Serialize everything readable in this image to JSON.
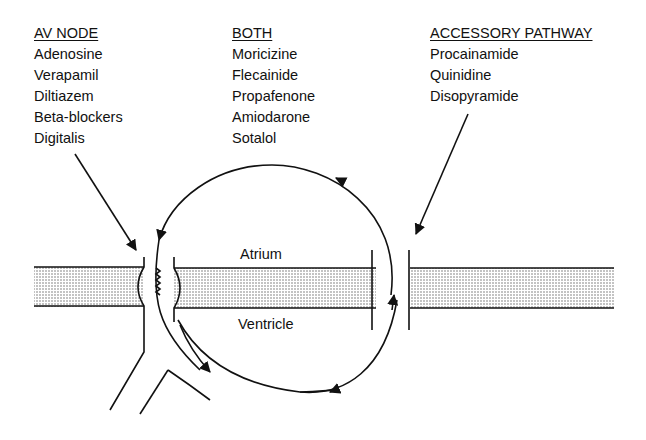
{
  "columns": [
    {
      "header": "AV NODE",
      "items": [
        "Adenosine",
        "Verapamil",
        "Diltiazem",
        "Beta-blockers",
        "Digitalis"
      ]
    },
    {
      "header": "BOTH",
      "items": [
        "Moricizine",
        "Flecainide",
        "Propafenone",
        "Amiodarone",
        "Sotalol"
      ]
    },
    {
      "header": "ACCESSORY PATHWAY",
      "items": [
        "Procainamide",
        "Quinidine",
        "Disopyramide"
      ]
    }
  ],
  "labels": {
    "atrium": "Atrium",
    "ventricle": "Ventricle"
  }
}
